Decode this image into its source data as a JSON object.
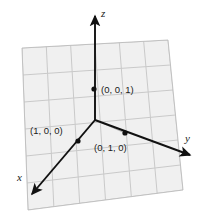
{
  "figure": {
    "background_color": "#ffffff",
    "plane": {
      "name": "grid-plane",
      "fill_color": "#f0f0f0",
      "grid_line_color": "#c9c9c9",
      "border_color": "#bdbdbd",
      "corners": [
        [
          22,
          48
        ],
        [
          168,
          40
        ],
        [
          183,
          190
        ],
        [
          28,
          210
        ]
      ],
      "columns": 6,
      "rows": 6
    },
    "axes": [
      {
        "id": "z",
        "label": "z",
        "label_x": 101,
        "label_y": 17,
        "color": "#111111",
        "from": [
          95,
          120
        ],
        "to": [
          95,
          16
        ]
      },
      {
        "id": "x",
        "label": "x",
        "label_x": 17,
        "label_y": 181,
        "color": "#111111",
        "from": [
          95,
          120
        ],
        "to": [
          32,
          194
        ]
      },
      {
        "id": "y",
        "label": "y",
        "label_x": 185,
        "label_y": 142,
        "color": "#111111",
        "from": [
          95,
          120
        ],
        "to": [
          190,
          155
        ]
      }
    ],
    "points": [
      {
        "id": "point-001",
        "label": "(0, 0, 1)",
        "x": 94,
        "y": 89,
        "label_x": 101,
        "label_y": 93,
        "color": "#111111",
        "radius": 2.6
      },
      {
        "id": "point-100",
        "label": "(1, 0, 0)",
        "x": 78,
        "y": 141,
        "label_x": 30,
        "label_y": 134,
        "color": "#111111",
        "radius": 2.6
      },
      {
        "id": "point-010",
        "label": "(0, 1, 0)",
        "x": 125,
        "y": 133,
        "label_x": 94,
        "label_y": 151,
        "color": "#111111",
        "radius": 2.6
      }
    ],
    "guide_lines": [
      {
        "id": "guide-to-x",
        "from": [
          95,
          120
        ],
        "to": [
          78,
          141
        ],
        "color": "#b4b4b4"
      },
      {
        "id": "guide-to-y",
        "from": [
          95,
          120
        ],
        "to": [
          125,
          133
        ],
        "color": "#b4b4b4"
      },
      {
        "id": "guide-to-z",
        "from": [
          95,
          120
        ],
        "to": [
          95,
          89
        ],
        "color": "#b4b4b4"
      }
    ]
  }
}
